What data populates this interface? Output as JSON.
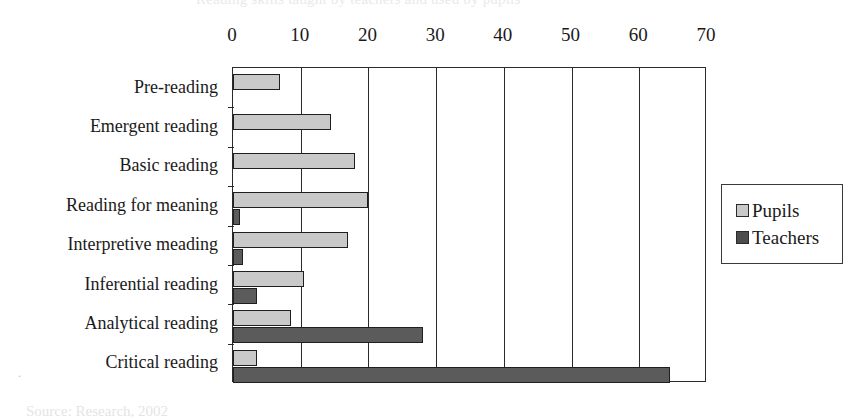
{
  "figure": {
    "top_clipped_caption": "Reading skills taught by teachers and used by pupils",
    "source_note": "Source: Research, 2002",
    "tiny_mark": "."
  },
  "legend": {
    "position": "right",
    "items": [
      {
        "label": "Pupils",
        "color": "#c9c9c9",
        "icon": "legend-swatch-pupils"
      },
      {
        "label": "Teachers",
        "color": "#4c4c4c",
        "icon": "legend-swatch-teachers"
      }
    ]
  },
  "chart_data": {
    "type": "bar",
    "orientation": "horizontal",
    "title": "",
    "xlabel": "",
    "ylabel": "",
    "xlim": [
      0,
      70
    ],
    "xticks": [
      0,
      10,
      20,
      30,
      40,
      50,
      60,
      70
    ],
    "xtick_labels": [
      "0",
      "10",
      "20",
      "30",
      "40",
      "50",
      "60",
      "70"
    ],
    "grid": true,
    "grid_axis": "x",
    "legend_position": "right",
    "categories": [
      "Pre-reading",
      "Emergent reading",
      "Basic reading",
      "Reading for meaning",
      "Interpretive meading",
      "Inferential reading",
      "Analytical reading",
      "Critical reading"
    ],
    "series": [
      {
        "name": "Pupils",
        "color": "#c9c9c9",
        "values": [
          7,
          14.5,
          18,
          20,
          17,
          10.5,
          8.5,
          3.5
        ]
      },
      {
        "name": "Teachers",
        "color": "#5b5b5b",
        "values": [
          0,
          0,
          0,
          1,
          1.5,
          3.5,
          28,
          64.5
        ]
      }
    ]
  }
}
